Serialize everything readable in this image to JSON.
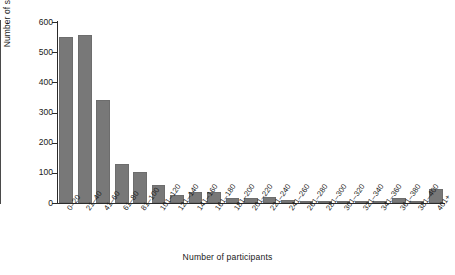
{
  "chart_data": {
    "type": "bar",
    "title": "",
    "xlabel": "Number of participants",
    "ylabel": "Number of studies",
    "ylim": [
      0,
      600
    ],
    "yticks": [
      0,
      100,
      200,
      300,
      400,
      500,
      600
    ],
    "grid": false,
    "legend": null,
    "bar_color": "#787878",
    "axis_color": "#2b2b2b",
    "annotations": [
      {
        "name": "vertical-reference-line",
        "type": "vline",
        "at_category": "281-300",
        "note": "thin vertical line drawn between the 281-300 and 301-320 bins"
      }
    ],
    "categories": [
      "0–20",
      "21–40",
      "41–60",
      "61–80",
      "81–100",
      "101–120",
      "121–140",
      "141–160",
      "161–180",
      "181–200",
      "201–220",
      "221–240",
      "241–260",
      "261–280",
      "281–300",
      "301–320",
      "321–340",
      "341–360",
      "361–380",
      "381–400",
      "401+"
    ],
    "values": [
      550,
      557,
      341,
      130,
      103,
      60,
      25,
      35,
      38,
      18,
      16,
      20,
      10,
      8,
      6,
      6,
      5,
      6,
      18,
      6,
      45
    ]
  }
}
